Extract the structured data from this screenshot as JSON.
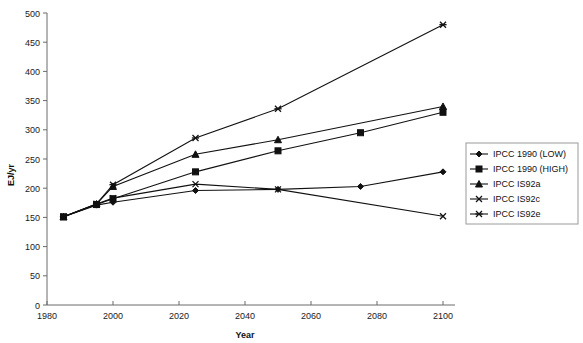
{
  "chart_data": {
    "type": "line",
    "title": "",
    "xlabel": "Year",
    "ylabel": "EJ/yr",
    "xlim": [
      1980,
      2100
    ],
    "ylim": [
      0,
      500
    ],
    "xticks": [
      1980,
      2000,
      2020,
      2040,
      2060,
      2080,
      2100
    ],
    "yticks": [
      0,
      50,
      100,
      150,
      200,
      250,
      300,
      350,
      400,
      450,
      500
    ],
    "grid": false,
    "legend_position": "right",
    "series": [
      {
        "name": "IPCC 1990 (LOW)",
        "marker": "diamond",
        "x": [
          1985,
          1995,
          2000,
          2025,
          2050,
          2075,
          2100
        ],
        "values": [
          151,
          171,
          176,
          196,
          198,
          203,
          228
        ]
      },
      {
        "name": "IPCC 1990 (HIGH)",
        "marker": "square",
        "x": [
          1985,
          1995,
          2000,
          2025,
          2050,
          2075,
          2100
        ],
        "values": [
          151,
          172,
          182,
          228,
          264,
          295,
          330
        ]
      },
      {
        "name": "IPCC IS92a",
        "marker": "triangle",
        "x": [
          1985,
          1995,
          2000,
          2025,
          2050,
          2100
        ],
        "values": [
          151,
          173,
          203,
          258,
          283,
          340
        ]
      },
      {
        "name": "IPCC IS92c",
        "marker": "x",
        "x": [
          1985,
          1995,
          2000,
          2025,
          2050,
          2100
        ],
        "values": [
          151,
          173,
          183,
          207,
          198,
          152
        ]
      },
      {
        "name": "IPCC IS92e",
        "marker": "star",
        "x": [
          1985,
          1995,
          2000,
          2025,
          2050,
          2100
        ],
        "values": [
          151,
          173,
          206,
          286,
          336,
          480
        ]
      }
    ]
  },
  "axes": {
    "y_title": "EJ/yr",
    "x_title": "Year",
    "y_tick_labels": [
      "500",
      "450",
      "400",
      "350",
      "300",
      "250",
      "200",
      "150",
      "100",
      "50",
      "0"
    ],
    "x_tick_labels": [
      "1980",
      "2000",
      "2020",
      "2040",
      "2060",
      "2080",
      "2100"
    ]
  },
  "legend": {
    "items": [
      {
        "label": "IPCC 1990 (LOW)",
        "marker": "diamond"
      },
      {
        "label": "IPCC 1990 (HIGH)",
        "marker": "square"
      },
      {
        "label": "IPCC IS92a",
        "marker": "triangle"
      },
      {
        "label": "IPCC IS92c",
        "marker": "x"
      },
      {
        "label": "IPCC IS92e",
        "marker": "star"
      }
    ]
  },
  "colors": {
    "series": "#111111",
    "axis": "#6b6b6b",
    "background": "#ffffff",
    "legend_border": "#9a9a9a"
  }
}
